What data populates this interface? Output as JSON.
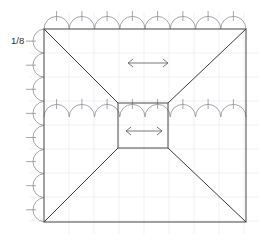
{
  "diagram": {
    "type": "architectural-roof-plan",
    "background_color": "#ffffff",
    "labels": {
      "slope_label": "1/8"
    },
    "geometry": {
      "outer_square": {
        "x": 44,
        "y": 29,
        "width": 202,
        "height": 193
      },
      "center_rect": {
        "x": 118,
        "y": 103,
        "width": 50,
        "height": 45
      },
      "grid_spacing_px": 25,
      "grid_color": "#e8e6ec",
      "outline_color": "#555555",
      "diagonal_color": "#3a3a3a",
      "scallop_color": "#8e8e96",
      "arrow_color": "#6a6a72"
    },
    "arrows": [
      {
        "name": "upper-flow-arrow",
        "direction": "bidirectional-horizontal",
        "x1": 128,
        "x2": 168,
        "y": 63
      },
      {
        "name": "center-flow-arrow",
        "direction": "bidirectional-horizontal",
        "x1": 126,
        "x2": 162,
        "y": 131
      }
    ],
    "scallop_runs": [
      {
        "name": "top-gutter",
        "orientation": "horizontal",
        "count": 8,
        "baseline": 29,
        "start": 44,
        "end": 246,
        "bulge": "up"
      },
      {
        "name": "left-gutter",
        "orientation": "vertical",
        "count": 8,
        "baseline": 44,
        "start": 29,
        "end": 222,
        "bulge": "left"
      },
      {
        "name": "mid-gutter",
        "orientation": "horizontal",
        "count": 8,
        "baseline": 117,
        "start": 44,
        "end": 246,
        "bulge": "up"
      }
    ],
    "diagonals": [
      {
        "name": "diagonal-top-left",
        "from": [
          44,
          29
        ],
        "to": [
          118,
          103
        ]
      },
      {
        "name": "diagonal-top-right",
        "from": [
          246,
          29
        ],
        "to": [
          168,
          103
        ]
      },
      {
        "name": "diagonal-bottom-left",
        "from": [
          44,
          222
        ],
        "to": [
          118,
          148
        ]
      },
      {
        "name": "diagonal-bottom-right",
        "from": [
          246,
          222
        ],
        "to": [
          168,
          148
        ]
      }
    ]
  }
}
